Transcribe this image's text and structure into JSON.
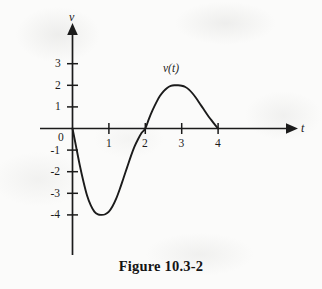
{
  "caption": "Figure 10.3-2",
  "axes": {
    "x_name": "t",
    "y_name": "v",
    "x_tick_labels": [
      "1",
      "2",
      "3",
      "4"
    ],
    "y_tick_labels": [
      "3",
      "2",
      "1",
      "0",
      "-1",
      "-2",
      "-3",
      "-4"
    ],
    "origin_label": "0"
  },
  "curve": {
    "label": "v(t)",
    "color": "#1b1b1b"
  },
  "chart_data": {
    "type": "line",
    "title": "Figure 10.3-2",
    "xlabel": "t",
    "ylabel": "v",
    "legend": [
      "v(t)"
    ],
    "legend_position": "inline-above-peak",
    "grid": false,
    "xlim": [
      -0.25,
      4.6
    ],
    "ylim": [
      -4.8,
      3.9
    ],
    "xticks": [
      1,
      2,
      3,
      4
    ],
    "yticks": [
      3,
      2,
      1,
      0,
      -1,
      -2,
      -3,
      -4
    ],
    "annotations": [
      {
        "text": "v(t)",
        "x": 2.55,
        "y": 2.6
      },
      {
        "text": "0",
        "x": -0.3,
        "y": -0.45
      }
    ],
    "series": [
      {
        "name": "v(t)",
        "x": [
          0.0,
          0.1,
          0.2,
          0.3,
          0.4,
          0.5,
          0.6,
          0.7,
          0.8,
          0.9,
          1.0,
          1.1,
          1.2,
          1.3,
          1.4,
          1.5,
          1.6,
          1.7,
          1.8,
          1.9,
          2.0,
          2.1,
          2.2,
          2.3,
          2.4,
          2.5,
          2.6,
          2.7,
          2.8,
          2.9,
          3.0,
          3.1,
          3.2,
          3.3,
          3.4,
          3.5,
          3.6,
          3.7,
          3.8,
          3.9,
          4.0
        ],
        "y": [
          0.0,
          -0.85,
          -1.7,
          -2.45,
          -3.1,
          -3.55,
          -3.85,
          -3.98,
          -4.0,
          -3.97,
          -3.85,
          -3.6,
          -3.25,
          -2.8,
          -2.3,
          -1.8,
          -1.3,
          -0.85,
          -0.5,
          -0.2,
          0.0,
          0.45,
          0.85,
          1.2,
          1.5,
          1.72,
          1.88,
          1.97,
          2.0,
          2.0,
          1.98,
          1.92,
          1.8,
          1.62,
          1.4,
          1.15,
          0.9,
          0.65,
          0.42,
          0.2,
          0.0
        ]
      }
    ],
    "key_points": [
      {
        "name": "start",
        "t": 0,
        "v": 0
      },
      {
        "name": "minimum",
        "t": 0.85,
        "v": -4
      },
      {
        "name": "zero-crossing",
        "t": 2,
        "v": 0
      },
      {
        "name": "maximum",
        "t": 2.85,
        "v": 2
      },
      {
        "name": "end",
        "t": 4,
        "v": 0
      }
    ]
  }
}
